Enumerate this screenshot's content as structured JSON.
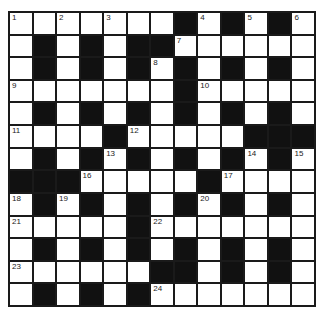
{
  "puzzle": {
    "rows": 13,
    "cols": 13,
    "colors": {
      "block": "#111111",
      "cell": "#ffffff",
      "border": "#1a1a1a",
      "number": "#222222"
    },
    "grid": [
      "...........##",
      "x",
      "x"
    ],
    "layout": [
      [
        "1",
        "",
        "2",
        "",
        "3",
        "",
        "",
        "#",
        "4",
        "#",
        "5",
        "#",
        "6"
      ],
      [
        "",
        "#",
        "",
        "#",
        "",
        "#",
        "#",
        "7",
        "",
        "",
        "",
        "",
        ""
      ],
      [
        "",
        "#",
        "",
        "#",
        "",
        "#",
        "8",
        "#",
        "",
        "#",
        "",
        "#",
        ""
      ],
      [
        "9",
        "",
        "",
        "",
        "",
        "",
        "",
        "#",
        "10",
        "",
        "",
        "",
        ""
      ],
      [
        "",
        "#",
        "",
        "#",
        "",
        "#",
        "",
        "#",
        "",
        "#",
        "",
        "#",
        ""
      ],
      [
        "11",
        "",
        "",
        "",
        "#",
        "12",
        "",
        "",
        "",
        "",
        "#",
        "#",
        "#"
      ],
      [
        "",
        "#",
        "",
        "#",
        "13",
        "#",
        "",
        "#",
        "",
        "#",
        "14",
        "#",
        "15"
      ],
      [
        "#",
        "#",
        "#",
        "16",
        "",
        "",
        "",
        "",
        "#",
        "17",
        "",
        "",
        ""
      ],
      [
        "18",
        "#",
        "19",
        "#",
        "",
        "#",
        "",
        "#",
        "20",
        "#",
        "",
        "#",
        ""
      ],
      [
        "21",
        "",
        "",
        "",
        "",
        "#",
        "22",
        "",
        "",
        "",
        "",
        "",
        ""
      ],
      [
        "",
        "#",
        "",
        "#",
        "",
        "#",
        "",
        "#",
        "",
        "#",
        "",
        "#",
        ""
      ],
      [
        "23",
        "",
        "",
        "",
        "",
        "",
        "#",
        "#",
        "",
        "#",
        "",
        "#",
        ""
      ],
      [
        "",
        "#",
        "",
        "#",
        "",
        "#",
        "24",
        "",
        "",
        "",
        "",
        "",
        ""
      ]
    ],
    "clue_numbers": [
      "1",
      "2",
      "3",
      "4",
      "5",
      "6",
      "7",
      "8",
      "9",
      "10",
      "11",
      "12",
      "13",
      "14",
      "15",
      "16",
      "17",
      "18",
      "19",
      "20",
      "21",
      "22",
      "23",
      "24"
    ]
  }
}
